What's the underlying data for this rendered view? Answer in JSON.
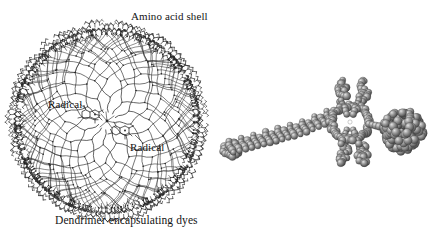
{
  "figure": {
    "background_color": "#ffffff",
    "ink_color": "#1a1a1a",
    "width": 435,
    "height": 233
  },
  "panels": [
    {
      "id": "dendrimer",
      "caption": "Dendrimer encapsulating dyes",
      "labels": [
        {
          "id": "amino-acid-shell",
          "text": "Amino acid shell"
        },
        {
          "id": "radical-1",
          "text": "Radical"
        },
        {
          "id": "radical-2",
          "text": "Radical"
        }
      ],
      "structure": {
        "type": "radial-dendrimer",
        "center": [
          107,
          121
        ],
        "core_radius": 9,
        "shell_radius": 93,
        "generations": 5,
        "primary_branches": 12,
        "terminal_group": "amino-acid",
        "encapsulated_dye_sites": 2
      }
    },
    {
      "id": "triad",
      "caption": "Light-to-charge converter",
      "labels": [
        {
          "id": "c-carotenoid",
          "text": "C"
        },
        {
          "id": "p-porphyrin",
          "text": "P"
        },
        {
          "id": "c60-fullerene",
          "text": "C",
          "subscript": "60"
        }
      ],
      "structure": {
        "type": "space-filling-molecular-model",
        "moieties": [
          "carotenoid",
          "porphyrin",
          "fullerene"
        ],
        "sphere_fill": "#8f8f8f",
        "sphere_highlight": "#d8d8d8",
        "sphere_shadow": "#4a4a4a"
      }
    }
  ]
}
